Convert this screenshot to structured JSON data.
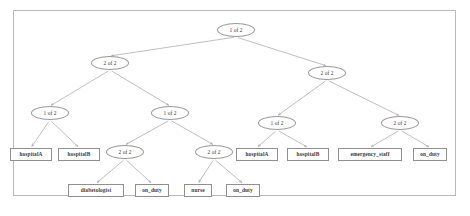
{
  "figure": {
    "kind": "and-or-decision-tree",
    "border_color": "#b9b9b9",
    "node_outline_color": "#9a9a9a",
    "edge_color": "#8a8a8a",
    "background": "#ffffff"
  },
  "nodes": [
    {
      "id": "n0",
      "label": "1 of 2",
      "shape": "ellipse",
      "x": 236,
      "y": 30
    },
    {
      "id": "n1",
      "label": "2 of 2",
      "shape": "ellipse",
      "x": 110,
      "y": 63
    },
    {
      "id": "n2",
      "label": "2 of 2",
      "shape": "ellipse",
      "x": 327,
      "y": 73
    },
    {
      "id": "n3",
      "label": "1 of 2",
      "shape": "ellipse",
      "x": 50,
      "y": 113
    },
    {
      "id": "n4",
      "label": "1 of 2",
      "shape": "ellipse",
      "x": 170,
      "y": 113
    },
    {
      "id": "n5",
      "label": "1 of 2",
      "shape": "ellipse",
      "x": 277,
      "y": 123
    },
    {
      "id": "n6",
      "label": "2 of 2",
      "shape": "ellipse",
      "x": 400,
      "y": 123
    },
    {
      "id": "n7",
      "label": "hospitalA",
      "shape": "box",
      "x": 31,
      "y": 154
    },
    {
      "id": "n8",
      "label": "hospitalB",
      "shape": "box",
      "x": 79,
      "y": 154
    },
    {
      "id": "n9",
      "label": "2 of 2",
      "shape": "ellipse",
      "x": 125,
      "y": 152
    },
    {
      "id": "n10",
      "label": "2 of 2",
      "shape": "ellipse",
      "x": 214,
      "y": 152
    },
    {
      "id": "n11",
      "label": "hospitalA",
      "shape": "box",
      "x": 257,
      "y": 154
    },
    {
      "id": "n12",
      "label": "hospitalB",
      "shape": "box",
      "x": 308,
      "y": 154
    },
    {
      "id": "n13",
      "label": "emergency_staff",
      "shape": "box",
      "x": 370,
      "y": 154
    },
    {
      "id": "n14",
      "label": "on_duty",
      "shape": "box",
      "x": 430,
      "y": 154
    },
    {
      "id": "n15",
      "label": "diabetologist",
      "shape": "box",
      "x": 96,
      "y": 190
    },
    {
      "id": "n16",
      "label": "on_duty",
      "shape": "box",
      "x": 152,
      "y": 190
    },
    {
      "id": "n17",
      "label": "nurse",
      "shape": "box",
      "x": 198,
      "y": 190
    },
    {
      "id": "n18",
      "label": "on_duty",
      "shape": "box",
      "x": 243,
      "y": 190
    }
  ],
  "edges": [
    {
      "from": "n0",
      "to": "n1"
    },
    {
      "from": "n0",
      "to": "n2"
    },
    {
      "from": "n1",
      "to": "n3"
    },
    {
      "from": "n1",
      "to": "n4"
    },
    {
      "from": "n2",
      "to": "n5"
    },
    {
      "from": "n2",
      "to": "n6"
    },
    {
      "from": "n3",
      "to": "n7"
    },
    {
      "from": "n3",
      "to": "n8"
    },
    {
      "from": "n4",
      "to": "n9"
    },
    {
      "from": "n4",
      "to": "n10"
    },
    {
      "from": "n5",
      "to": "n11"
    },
    {
      "from": "n5",
      "to": "n12"
    },
    {
      "from": "n6",
      "to": "n13"
    },
    {
      "from": "n6",
      "to": "n14"
    },
    {
      "from": "n9",
      "to": "n15"
    },
    {
      "from": "n9",
      "to": "n16"
    },
    {
      "from": "n10",
      "to": "n17"
    },
    {
      "from": "n10",
      "to": "n18"
    }
  ]
}
